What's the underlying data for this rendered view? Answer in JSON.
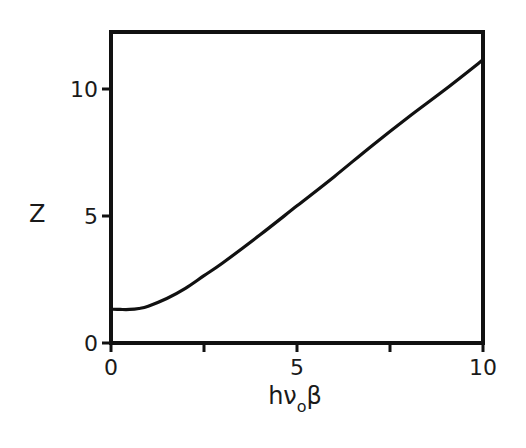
{
  "chart_data": {
    "type": "line",
    "title": "",
    "xlabel": "hνoβ",
    "xlabel_parts": {
      "main": "hν",
      "sub": "o",
      "tail": "β"
    },
    "ylabel": "Z",
    "xlim": [
      0,
      10
    ],
    "ylim": [
      0,
      12.3
    ],
    "grid": false,
    "legend": null,
    "x_ticks": [
      0,
      2.5,
      5,
      7.5,
      10
    ],
    "x_tick_labels": [
      "0",
      "",
      "5",
      "",
      "10"
    ],
    "y_ticks": [
      0,
      5,
      10
    ],
    "y_tick_labels": [
      "0",
      "5",
      "10"
    ],
    "series": [
      {
        "name": "Z",
        "x": [
          0,
          0.25,
          0.5,
          0.75,
          1,
          1.5,
          2,
          2.5,
          3,
          4,
          5,
          6,
          7,
          8,
          9,
          10
        ],
        "values": [
          1.33,
          1.32,
          1.32,
          1.36,
          1.45,
          1.75,
          2.15,
          2.65,
          3.15,
          4.25,
          5.4,
          6.55,
          7.75,
          8.9,
          10.0,
          11.15
        ]
      }
    ]
  }
}
